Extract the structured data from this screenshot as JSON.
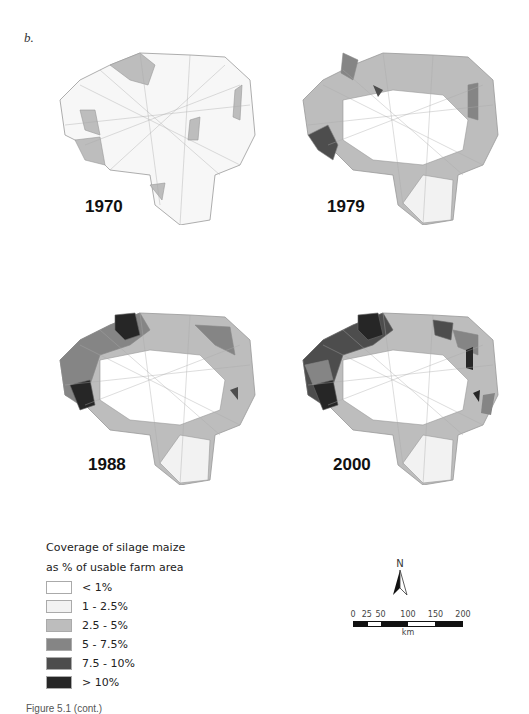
{
  "panel_label": "b.",
  "maps": [
    {
      "year": "1970"
    },
    {
      "year": "1979"
    },
    {
      "year": "1988"
    },
    {
      "year": "2000"
    }
  ],
  "legend": {
    "title_line1": "Coverage of silage maize",
    "title_line2": "as % of usable farm area",
    "classes": [
      {
        "label": "< 1%",
        "color": "#ffffff"
      },
      {
        "label": "1 - 2.5%",
        "color": "#f2f2f2"
      },
      {
        "label": "2.5 - 5%",
        "color": "#bdbdbd"
      },
      {
        "label": "5 - 7.5%",
        "color": "#858585"
      },
      {
        "label": "7.5 - 10%",
        "color": "#4d4d4d"
      },
      {
        "label": "> 10%",
        "color": "#262626"
      }
    ]
  },
  "north_arrow": {
    "label": "N"
  },
  "scale_bar": {
    "ticks": [
      "0",
      "25",
      "50",
      "100",
      "150",
      "200"
    ],
    "unit": "km"
  },
  "caption": "Figure 5.1  (cont.)"
}
